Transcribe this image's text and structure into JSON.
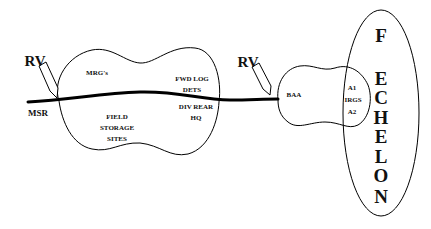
{
  "diagram": {
    "colors": {
      "line": "#000000",
      "text": "#111111",
      "background": "#ffffff"
    },
    "road": {
      "label": "MSR"
    },
    "release_points": [
      {
        "label": "RV"
      },
      {
        "label": "RV"
      }
    ],
    "left_area": {
      "labels": {
        "mrgs": "MRG's",
        "fwd_log": "FWD LOG",
        "dets": "DETS",
        "div_rear": "DIV REAR",
        "hq": "HQ",
        "field": "FIELD",
        "storage": "STORAGE",
        "sites": "SITES"
      }
    },
    "baa_area": {
      "labels": {
        "baa": "BAA",
        "a1": "A1",
        "irgs": "IRGS",
        "a2": "A2"
      }
    },
    "echelon": {
      "letters": [
        "F",
        "E",
        "C",
        "H",
        "E",
        "L",
        "O",
        "N"
      ]
    }
  }
}
